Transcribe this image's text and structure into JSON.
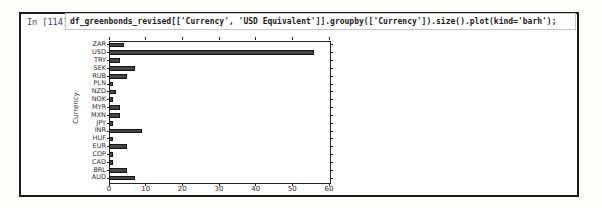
{
  "notebook": {
    "prompt": "In [114]:",
    "code": "df_greenbonds_revised[['Currency', 'USD Equivalent']].groupby(['Currency']).size().plot(kind='barh');"
  },
  "chart_data": {
    "type": "bar",
    "orientation": "horizontal",
    "title": "",
    "xlabel": "",
    "ylabel": "Currency",
    "categories_top_to_bottom": [
      "ZAR",
      "USD",
      "TRY",
      "SEK",
      "RUB",
      "PLN",
      "NZD",
      "NOK",
      "MYR",
      "MXN",
      "JPY",
      "INR",
      "HUF",
      "EUR",
      "COP",
      "CAD",
      "BRL",
      "AUD"
    ],
    "values": [
      4,
      56,
      3,
      7,
      5,
      1,
      2,
      1,
      3,
      3,
      1,
      9,
      1,
      5,
      1,
      1,
      5,
      7
    ],
    "xlim": [
      0,
      60
    ],
    "xticks": [
      0,
      10,
      20,
      30,
      40,
      50,
      60
    ],
    "grid": false,
    "legend": "none",
    "bar_color": "#454545",
    "bar_edge_color": "#141414"
  },
  "colors": {
    "frame_border": "#1c1c1c",
    "axes_border": "#222222",
    "prompt_text": "#37415a",
    "code_text": "#1b1b1b"
  }
}
